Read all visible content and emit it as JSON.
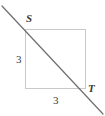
{
  "figure": {
    "width": 105,
    "height": 116,
    "background_color": "#ffffff"
  },
  "square": {
    "name": "square",
    "x": 25,
    "y": 29,
    "width": 61,
    "height": 60,
    "stroke_color": "#c9c9c9",
    "stroke_width": 1,
    "fill": "none"
  },
  "diagonal": {
    "name": "diagonal-line",
    "x1": 2,
    "y1": 6,
    "x2": 103,
    "y2": 114,
    "stroke_color": "#6e6e6e",
    "stroke_width": 1.2
  },
  "labels": {
    "vertex_s": "S",
    "vertex_t": "T",
    "side_left": "3",
    "side_bottom": "3",
    "text_color": "#3a3a3a"
  },
  "chart_data": {
    "type": "diagram",
    "shapes": [
      {
        "kind": "square",
        "side_length": 3,
        "corners": [
          {
            "label": "S",
            "position": "top-left"
          },
          {
            "label": "",
            "position": "top-right"
          },
          {
            "label": "T",
            "position": "bottom-right"
          },
          {
            "label": "",
            "position": "bottom-left"
          }
        ]
      },
      {
        "kind": "line",
        "through": [
          "S",
          "T"
        ],
        "description": "diagonal extending beyond both vertices"
      }
    ],
    "measurements": [
      {
        "side": "left",
        "value": 3
      },
      {
        "side": "bottom",
        "value": 3
      }
    ]
  }
}
